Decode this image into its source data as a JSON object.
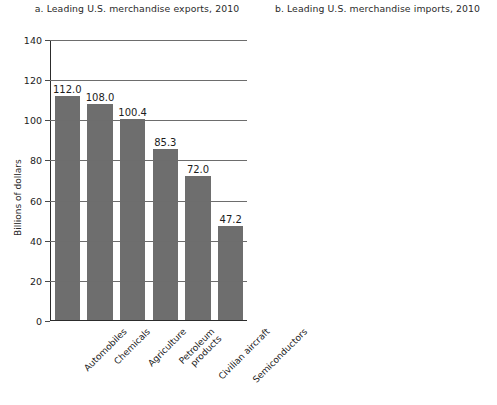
{
  "figure": {
    "ylabel": "Billions of dollars"
  },
  "chart_data": [
    {
      "type": "bar",
      "title": "a. Leading U.S. merchandise exports, 2010",
      "xlabel": "",
      "ylabel": "Billions of dollars",
      "ylim": [
        0,
        140
      ],
      "yticks": [
        0,
        20,
        40,
        60,
        80,
        100,
        120,
        140
      ],
      "ytick_labels": [
        "0",
        "20",
        "40",
        "60",
        "80",
        "100",
        "120",
        "140"
      ],
      "grid": true,
      "legend": "none",
      "bar_color": "#6e6e6e",
      "categories": [
        "Automobiles",
        "Chemicals",
        "Agriculture",
        "Petroleum products",
        "Civilian aircraft",
        "Semiconductors"
      ],
      "category_lines": [
        [
          "Automobiles"
        ],
        [
          "Chemicals"
        ],
        [
          "Agriculture"
        ],
        [
          "Petroleum",
          "products"
        ],
        [
          "Civilian aircraft"
        ],
        [
          "Semiconductors"
        ]
      ],
      "values": [
        112.0,
        108.0,
        100.4,
        85.3,
        72.0,
        47.2
      ],
      "value_labels": [
        "112.0",
        "108.0",
        "100.4",
        "85.3",
        "72.0",
        "47.2"
      ]
    },
    {
      "type": "bar",
      "title": "b. Leading U.S. merchandise imports, 2010",
      "xlabel": "",
      "ylabel": "Billions of dollars",
      "ylim": [
        0,
        400
      ],
      "yticks": [
        0,
        50,
        100,
        150,
        200,
        250,
        300,
        350,
        400
      ],
      "ytick_labels": [
        "0",
        "50",
        "100",
        "150",
        "200",
        "250",
        "300",
        "350",
        "400"
      ],
      "grid": true,
      "legend": "none",
      "bar_color": "#6e6e6e",
      "categories": [
        "Petroleum products",
        "Automobiles",
        "Household appliances",
        "Computers",
        "Pharmaceuticals",
        "Agriculture"
      ],
      "category_lines": [
        [
          "Petroleum",
          "products"
        ],
        [
          "Automobiles"
        ],
        [
          "Household",
          "appliances"
        ],
        [
          "Computers"
        ],
        [
          "Pharmaceuticals"
        ],
        [
          "Agriculture"
        ]
      ],
      "values": [
        353.7,
        225.6,
        123.7,
        117.3,
        85.5,
        71.5
      ],
      "value_labels": [
        "353.7",
        "225.6",
        "123.7",
        "117.3",
        "85.5",
        "71.5"
      ]
    }
  ]
}
